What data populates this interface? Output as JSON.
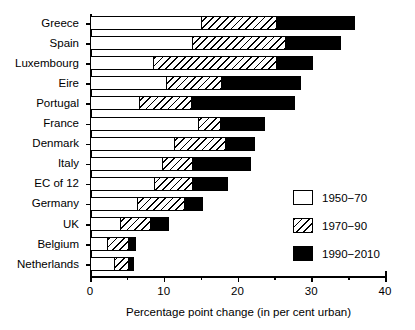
{
  "chart_data": {
    "type": "bar",
    "orientation": "horizontal",
    "stacked": true,
    "title": "",
    "xlabel": "Percentage point change (in per cent urban)",
    "ylabel": "",
    "xlim": [
      0,
      40
    ],
    "xticks": [
      0,
      10,
      20,
      30,
      40
    ],
    "xtick_labels": [
      "0",
      "10",
      "20",
      "30",
      "40"
    ],
    "xminor_step": 5,
    "grid": false,
    "legend_position": "middle-right",
    "categories": [
      "Greece",
      "Spain",
      "Luxembourg",
      "Eire",
      "Portugal",
      "France",
      "Denmark",
      "Italy",
      "EC of 12",
      "Germany",
      "UK",
      "Belgium",
      "Netherlands"
    ],
    "series": [
      {
        "name": "1950−70",
        "fill": "white",
        "color": "#ffffff",
        "values": [
          15.2,
          14.0,
          8.7,
          10.4,
          6.8,
          14.8,
          11.6,
          9.9,
          8.9,
          6.5,
          4.2,
          2.4,
          3.4
        ]
      },
      {
        "name": "1970−90",
        "fill": "hatched",
        "color": "#ffffff",
        "values": [
          10.3,
          12.7,
          16.9,
          7.7,
          7.2,
          3.1,
          7.0,
          4.3,
          5.3,
          6.5,
          4.3,
          3.1,
          2.1
        ]
      },
      {
        "name": "1990−2010",
        "fill": "black",
        "color": "#000000",
        "values": [
          10.8,
          7.6,
          5.0,
          10.8,
          14.1,
          6.1,
          4.1,
          7.9,
          4.9,
          2.7,
          2.5,
          1.0,
          0.8
        ]
      }
    ],
    "totals": [
      36.3,
      34.3,
      30.6,
      28.9,
      28.1,
      24.0,
      22.7,
      22.1,
      19.1,
      15.7,
      11.0,
      6.5,
      6.3
    ],
    "legend": [
      {
        "label": "1950−70",
        "fill": "white"
      },
      {
        "label": "1970−90",
        "fill": "hatched"
      },
      {
        "label": "1990−2010",
        "fill": "black"
      }
    ]
  }
}
